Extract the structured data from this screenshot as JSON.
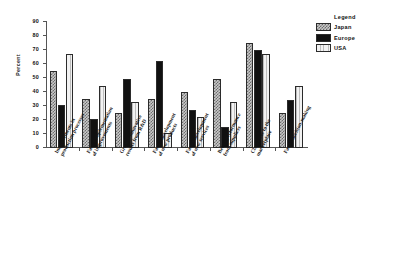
{
  "chart_data": {
    "type": "bar",
    "title": "",
    "xlabel": "",
    "ylabel": "Percent",
    "ylim": [
      0,
      90
    ],
    "yticks": [
      0,
      10,
      20,
      30,
      40,
      50,
      60,
      70,
      80,
      90
    ],
    "grid": false,
    "legend_position": "right",
    "legend_title": "Legend",
    "categories": [
      "Improvements in production processes",
      "Faster implementation of improvements",
      "Greater innovative results from R&D",
      "Faster development of new products",
      "Faster development of new services",
      "Better performance from suppliers",
      "Closer ties to the marketplace",
      "Faster decision-making"
    ],
    "category_lines": [
      [
        "Improvements in",
        "production processes"
      ],
      [
        "Faster implementation",
        "of improvements"
      ],
      [
        "Greater innovative",
        "results from R&D"
      ],
      [
        "Faster development",
        "of new products"
      ],
      [
        "Faster development",
        "of new services"
      ],
      [
        "Better performance",
        "from suppliers"
      ],
      [
        "Closer ties to the",
        "marketplace"
      ],
      [
        "Faster decision-making"
      ]
    ],
    "series": [
      {
        "name": "Japan",
        "color": "#c8c8c8",
        "pattern": "crosshatch",
        "values": [
          55,
          35,
          25,
          35,
          40,
          49,
          75,
          25
        ]
      },
      {
        "name": "Europe",
        "color": "#111111",
        "pattern": "solid",
        "values": [
          31,
          21,
          49,
          62,
          27,
          15,
          70,
          34
        ]
      },
      {
        "name": "USA",
        "color": "#e4e4e4",
        "pattern": "vertical-lines",
        "values": [
          67,
          44,
          33,
          11,
          22,
          33,
          67,
          44
        ]
      }
    ]
  }
}
